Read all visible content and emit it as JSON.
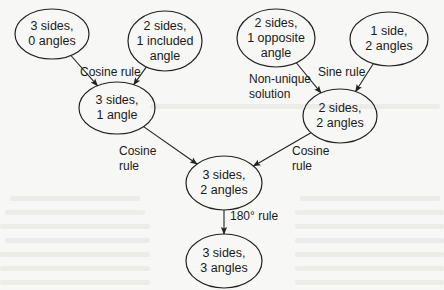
{
  "diagram": {
    "title": "",
    "colors": {
      "background": "#f7f7f5",
      "stroke": "#222222",
      "text": "#1a1a1a"
    },
    "nodes": [
      {
        "id": "n1",
        "label": "3 sides,\n0 angles",
        "cx": 52,
        "cy": 34,
        "rx": 37,
        "ry": 25
      },
      {
        "id": "n2",
        "label": "2 sides,\n1 included\nangle",
        "cx": 165,
        "cy": 41,
        "rx": 37,
        "ry": 30
      },
      {
        "id": "n3",
        "label": "3 sides,\n1 angle",
        "cx": 117,
        "cy": 108,
        "rx": 38,
        "ry": 26
      },
      {
        "id": "n4",
        "label": "2 sides,\n1 opposite\nangle",
        "cx": 276,
        "cy": 38,
        "rx": 39,
        "ry": 29
      },
      {
        "id": "n5",
        "label": "1 side,\n2 angles",
        "cx": 389,
        "cy": 39,
        "rx": 39,
        "ry": 27
      },
      {
        "id": "n6",
        "label": "2 sides,\n2 angles",
        "cx": 340,
        "cy": 116,
        "rx": 37,
        "ry": 27
      },
      {
        "id": "n7",
        "label": "3 sides,\n2 angles",
        "cx": 224,
        "cy": 183,
        "rx": 38,
        "ry": 27
      },
      {
        "id": "n8",
        "label": "3 sides,\n3 angles",
        "cx": 224,
        "cy": 261,
        "rx": 38,
        "ry": 27
      }
    ],
    "edges": [
      {
        "from": "n1",
        "to": "n3",
        "label": ""
      },
      {
        "from": "n2",
        "to": "n3",
        "label": ""
      },
      {
        "from": "n4",
        "to": "n6",
        "label": ""
      },
      {
        "from": "n5",
        "to": "n6",
        "label": ""
      },
      {
        "from": "n3",
        "to": "n7",
        "label": ""
      },
      {
        "from": "n6",
        "to": "n7",
        "label": ""
      },
      {
        "from": "n7",
        "to": "n8",
        "label": ""
      }
    ],
    "edge_labels": [
      {
        "id": "l1",
        "text": "Cosine rule",
        "x": 80,
        "y": 65
      },
      {
        "id": "l2",
        "text": "Non-unique\nsolution",
        "x": 249,
        "y": 72
      },
      {
        "id": "l3",
        "text": "Sine rule",
        "x": 318,
        "y": 65
      },
      {
        "id": "l4",
        "text": "Cosine\nrule",
        "x": 119,
        "y": 144
      },
      {
        "id": "l5",
        "text": "Cosine\nrule",
        "x": 292,
        "y": 144
      },
      {
        "id": "l6",
        "text": "180° rule",
        "x": 230,
        "y": 209
      }
    ]
  }
}
